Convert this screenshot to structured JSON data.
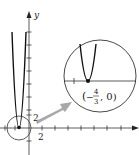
{
  "figure": {
    "type": "graph-with-magnified-inset",
    "axes": {
      "x_label": "",
      "y_label": "y",
      "x_tick_label": "2",
      "y_tick_label": "2"
    },
    "inset": {
      "point_label_open": "(",
      "point_label_minus": "−",
      "point_label_num": "4",
      "point_label_den": "3",
      "point_label_rest": ", 0)"
    },
    "colors": {
      "axis": "#333333",
      "curve": "#111111",
      "arrow": "#a8a8a8",
      "circle": "#333333"
    }
  }
}
